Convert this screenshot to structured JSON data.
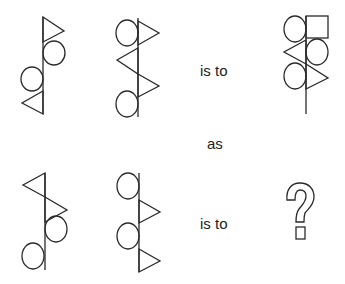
{
  "puzzle": {
    "type": "visual-analogy",
    "row1": {
      "figure_a": {
        "stem": "vertical line",
        "elements": [
          "triangle-right (top)",
          "circle-right",
          "circle-left",
          "triangle-left (bottom)"
        ]
      },
      "figure_b": {
        "stem": "vertical line",
        "elements": [
          "circle-left + triangle-right (top)",
          "triangle-left",
          "triangle-right",
          "circle-left (bottom)"
        ]
      },
      "connector": "is to",
      "figure_c": {
        "stem": "vertical line",
        "elements": [
          "circle-left + square-right (top)",
          "triangle-left + circle-right",
          "circle-left + triangle-right"
        ]
      }
    },
    "middle_word": "as",
    "row2": {
      "figure_a": {
        "stem": "vertical line",
        "elements": [
          "triangle-left (top)",
          "triangle-right",
          "circle-right",
          "circle-left (bottom)"
        ]
      },
      "figure_b": {
        "stem": "vertical line",
        "elements": [
          "circle-left (top)",
          "triangle-right",
          "circle-left",
          "triangle-right (bottom)"
        ]
      },
      "connector": "is to",
      "answer": "?"
    }
  },
  "colors": {
    "stroke": "#2a2a2a",
    "text": "#222222",
    "background": "#ffffff"
  }
}
